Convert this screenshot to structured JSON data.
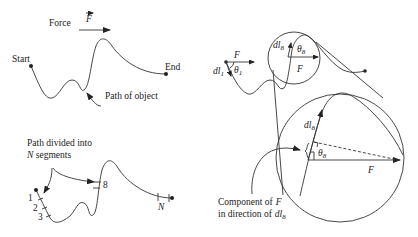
{
  "panel_top_left": {
    "force_label": "Force",
    "force_symbol": "F",
    "start_label": "Start",
    "end_label": "End",
    "path_label": "Path of object"
  },
  "panel_bottom_left": {
    "caption_line1": "Path divided into",
    "caption_n": "N",
    "caption_line2": " segments",
    "segment_labels": [
      "1",
      "2",
      "3",
      "8",
      "N"
    ]
  },
  "panel_right": {
    "small_view": {
      "force_symbol": "F",
      "dl1_symbol": "dl",
      "dl1_sub": "1",
      "theta1": "θ",
      "theta1_sub": "1",
      "dl8_symbol": "dl",
      "dl8_sub": "8",
      "theta8": "θ",
      "theta8_sub": "8",
      "force_symbol_2": "F"
    },
    "magnified_view": {
      "dl8_symbol": "dl",
      "dl8_sub": "8",
      "theta8": "θ",
      "theta8_sub": "8",
      "force_symbol": "F"
    },
    "component_caption_line1": "Component of",
    "component_caption_F": "F",
    "component_caption_line2": "in direction of",
    "component_caption_dl": "dl",
    "component_caption_sub": "8"
  },
  "colors": {
    "line": "#333333",
    "text": "#222222",
    "background": "#ffffff"
  }
}
